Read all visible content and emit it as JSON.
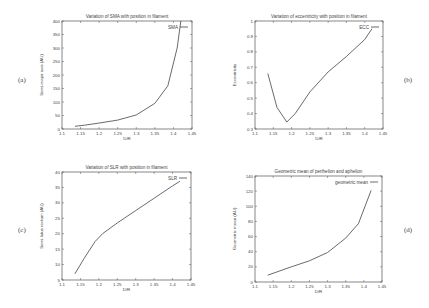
{
  "figure": {
    "panels": [
      {
        "id": "a",
        "label": "(a)"
      },
      {
        "id": "b",
        "label": "(b)"
      },
      {
        "id": "c",
        "label": "(c)"
      },
      {
        "id": "d",
        "label": "(d)"
      }
    ]
  },
  "chart_data": [
    {
      "type": "line",
      "panel": "(a)",
      "title": "Variation of SMA with position in filament",
      "xlabel": "D/R",
      "ylabel": "Semi-major axis (AU)",
      "xlim": [
        1.1,
        1.45
      ],
      "ylim": [
        0,
        400
      ],
      "xticks": [
        "1.1",
        "1.15",
        "1.2",
        "1.25",
        "1.3",
        "1.35",
        "1.4",
        "1.45"
      ],
      "yticks": [
        "0",
        "50",
        "100",
        "150",
        "200",
        "250",
        "300",
        "350",
        "400"
      ],
      "grid": false,
      "legend_position": "top-right",
      "series": [
        {
          "name": "SMA",
          "x": [
            1.135,
            1.16,
            1.2,
            1.25,
            1.3,
            1.35,
            1.385,
            1.41,
            1.42
          ],
          "y": [
            10,
            14,
            22,
            33,
            52,
            95,
            160,
            300,
            400
          ]
        }
      ]
    },
    {
      "type": "line",
      "panel": "(b)",
      "title": "Variation of eccentricity with position in filament",
      "xlabel": "D/R",
      "ylabel": "Eccentricity",
      "xlim": [
        1.1,
        1.45
      ],
      "ylim": [
        0.3,
        1
      ],
      "xticks": [
        "1.1",
        "1.15",
        "1.2",
        "1.25",
        "1.3",
        "1.35",
        "1.4",
        "1.45"
      ],
      "yticks": [
        "0.3",
        "0.4",
        "0.5",
        "0.6",
        "0.7",
        "0.8",
        "0.9",
        "1"
      ],
      "grid": false,
      "legend_position": "top-right",
      "series": [
        {
          "name": "ECC",
          "x": [
            1.135,
            1.16,
            1.187,
            1.21,
            1.25,
            1.3,
            1.35,
            1.4,
            1.42
          ],
          "y": [
            0.66,
            0.44,
            0.345,
            0.4,
            0.54,
            0.67,
            0.77,
            0.88,
            0.95
          ]
        }
      ]
    },
    {
      "type": "line",
      "panel": "(c)",
      "title": "Variation of SLR with position in filament",
      "xlabel": "D/R",
      "ylabel": "Semi-latus rectum (AU)",
      "xlim": [
        1.1,
        1.45
      ],
      "ylim": [
        5,
        40
      ],
      "xticks": [
        "1.1",
        "1.15",
        "1.2",
        "1.25",
        "1.3",
        "1.35",
        "1.4",
        "1.45"
      ],
      "yticks": [
        "5",
        "10",
        "15",
        "20",
        "25",
        "30",
        "35",
        "40"
      ],
      "grid": false,
      "legend_position": "top-right",
      "series": [
        {
          "name": "SLR",
          "x": [
            1.135,
            1.16,
            1.19,
            1.21,
            1.25,
            1.3,
            1.35,
            1.4,
            1.42
          ],
          "y": [
            7,
            12,
            17.5,
            20,
            23.5,
            27.5,
            31.5,
            35.5,
            37
          ]
        }
      ]
    },
    {
      "type": "line",
      "panel": "(d)",
      "title": "Geometric mean of perihelion and aphelion",
      "xlabel": "D/R",
      "ylabel": "Geometric mean (AU)",
      "xlim": [
        1.1,
        1.45
      ],
      "ylim": [
        0,
        140
      ],
      "xticks": [
        "1.1",
        "1.15",
        "1.2",
        "1.25",
        "1.3",
        "1.35",
        "1.4",
        "1.45"
      ],
      "yticks": [
        "0",
        "20",
        "40",
        "60",
        "80",
        "100",
        "120",
        "140"
      ],
      "grid": false,
      "legend_position": "top-right",
      "series": [
        {
          "name": "geometric mean",
          "x": [
            1.135,
            1.2,
            1.25,
            1.3,
            1.35,
            1.385,
            1.42
          ],
          "y": [
            9,
            20,
            28,
            39,
            58,
            77,
            121
          ]
        }
      ]
    }
  ]
}
